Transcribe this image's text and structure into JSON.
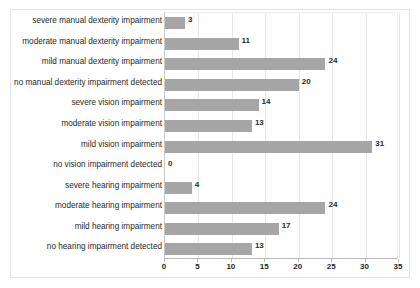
{
  "chart_data": {
    "type": "bar",
    "orientation": "horizontal",
    "title": "",
    "subtitle": "",
    "xlabel": "",
    "ylabel": "",
    "xlim": [
      0,
      35
    ],
    "xticks": [
      0,
      5,
      10,
      15,
      20,
      25,
      30,
      35
    ],
    "xtick_labels": [
      "0",
      "5",
      "10",
      "15",
      "20",
      "25",
      "30",
      "35"
    ],
    "grid": true,
    "grid_axis": "x",
    "legend": false,
    "legend_position": "none",
    "bar_color": "#a6a6a6",
    "categories": [
      "severe manual  dexterity  impairment",
      "moderate manual  dexterity  impairment",
      "mild manual  dexterity  impairment",
      "no manual dexterity  impairment detected",
      "severe vision impairment",
      "moderate vision impairment",
      "mild vision impairment",
      "no vision impairment detected",
      "severe hearing impairment",
      "moderate hearing impairment",
      "mild hearing impairment",
      "no hearing impairment detected"
    ],
    "values": [
      3,
      11,
      24,
      20,
      14,
      13,
      31,
      0,
      4,
      24,
      17,
      13
    ],
    "data_labels": [
      "3",
      "11",
      "24",
      "20",
      "14",
      "13",
      "31",
      "0",
      "4",
      "24",
      "17",
      "13"
    ]
  }
}
